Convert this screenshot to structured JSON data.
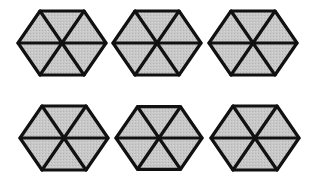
{
  "figure": {
    "fill_color": "#c8c8c8",
    "stroke_color": "#111111",
    "stroke_width": 3.2,
    "hexagons": [
      {
        "row": 1,
        "col": 1,
        "cx": 62,
        "cy": 43,
        "r": 44,
        "divisions": 6
      },
      {
        "row": 1,
        "col": 2,
        "cx": 157,
        "cy": 43,
        "r": 44,
        "divisions": 6
      },
      {
        "row": 1,
        "col": 3,
        "cx": 253,
        "cy": 43,
        "r": 44,
        "divisions": 6
      },
      {
        "row": 2,
        "col": 1,
        "cx": 64,
        "cy": 138,
        "r": 44,
        "divisions": 6
      },
      {
        "row": 2,
        "col": 2,
        "cx": 159,
        "cy": 138,
        "r": 43,
        "divisions": 6
      },
      {
        "row": 2,
        "col": 3,
        "cx": 255,
        "cy": 138,
        "r": 44,
        "divisions": 6
      }
    ]
  }
}
